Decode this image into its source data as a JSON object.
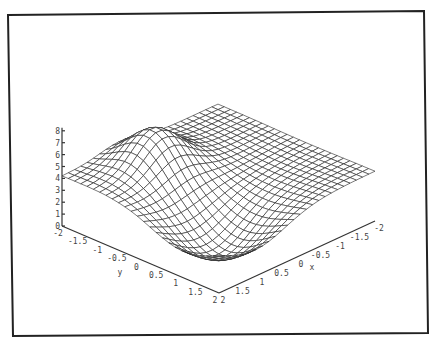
{
  "chart_data": {
    "type": "surface3d",
    "title": "",
    "xlabel": "x",
    "ylabel": "y",
    "zlabel": "",
    "x_ticks": [
      "-2",
      "-1.5",
      "-1",
      "-0.5",
      "0",
      "0.5",
      "1",
      "1.5",
      "2"
    ],
    "y_ticks": [
      "-2",
      "-1.5",
      "-1",
      "-0.5",
      "0",
      "0.5",
      "1",
      "1.5",
      "2"
    ],
    "z_ticks": [
      "0",
      "1",
      "2",
      "3",
      "4",
      "5",
      "6",
      "7",
      "8"
    ],
    "xlim": [
      -2,
      2
    ],
    "ylim": [
      -2,
      2
    ],
    "zlim": [
      0,
      8
    ],
    "grid_resolution": 25,
    "surface_description": "Wireframe surface ~4 at the edges, a peak of ~7 near x≈0.5, y≈-1, and a valley of ~0.5 near x≈1, y≈1",
    "frame": true
  },
  "colors": {
    "line": "#222222",
    "axis": "#333333",
    "frame": "#222222",
    "background": "#ffffff"
  }
}
